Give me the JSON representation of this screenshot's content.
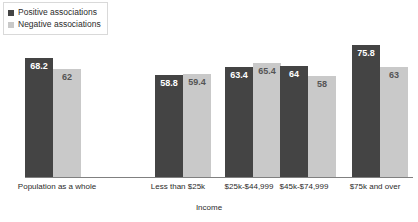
{
  "legend": {
    "items": [
      {
        "label": "Positive associations",
        "color": "#444444",
        "key": "positive"
      },
      {
        "label": "Negative associations",
        "color": "#c9c9c9",
        "key": "negative"
      }
    ]
  },
  "axis": {
    "x_title": "Income"
  },
  "chart_data": {
    "type": "bar",
    "title": "",
    "xlabel": "Income",
    "ylabel": "",
    "ylim": [
      0,
      80
    ],
    "grid": false,
    "legend_position": "top-left",
    "categories": [
      "Population as a whole",
      "Less than $25k",
      "$25k-$44,999",
      "$45k-$74,999",
      "$75k and over"
    ],
    "series": [
      {
        "name": "Positive associations",
        "color": "#444444",
        "values": [
          68.2,
          58.8,
          63.4,
          64,
          75.8
        ],
        "labels": [
          "68.2",
          "58.8",
          "63.4",
          "64",
          "75.8"
        ]
      },
      {
        "name": "Negative associations",
        "color": "#c9c9c9",
        "values": [
          62,
          59.4,
          65.4,
          58,
          63
        ],
        "labels": [
          "62",
          "59.4",
          "65.4",
          "58",
          "63"
        ]
      }
    ]
  },
  "layout": {
    "groups": [
      {
        "left": 25,
        "label_left": 12,
        "label_width": 90
      },
      {
        "left": 155,
        "label_left": 142,
        "label_width": 72
      },
      {
        "left": 225,
        "label_left": 210,
        "label_width": 78
      },
      {
        "left": 280,
        "label_left": 265,
        "label_width": 78
      },
      {
        "left": 352,
        "label_left": 336,
        "label_width": 78
      }
    ],
    "bar_width": 28,
    "gap": 0,
    "value_scale": 1.74,
    "baseline_top": 177
  }
}
